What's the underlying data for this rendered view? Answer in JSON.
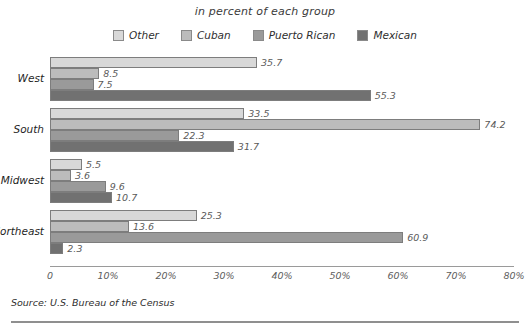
{
  "title": "in percent of each group",
  "source": "Source: U.S. Bureau of the Census",
  "axis": {
    "ticks": [
      "0",
      "10%",
      "20%",
      "30%",
      "40%",
      "50%",
      "60%",
      "70%",
      "80%"
    ]
  },
  "legend": {
    "items": [
      {
        "label": "Other",
        "color": "#d8d8d8"
      },
      {
        "label": "Cuban",
        "color": "#bcbcbc"
      },
      {
        "label": "Puerto Rican",
        "color": "#9a9a9a"
      },
      {
        "label": "Mexican",
        "color": "#717171"
      }
    ]
  },
  "chart_data": {
    "type": "bar",
    "orientation": "horizontal",
    "title": "in percent of each group",
    "xlabel": "",
    "ylabel": "",
    "xlim": [
      0,
      80
    ],
    "grid": false,
    "legend_position": "top-center",
    "categories": [
      "West",
      "South",
      "Midwest",
      "Northeast"
    ],
    "series": [
      {
        "name": "Other",
        "color": "#d8d8d8",
        "values": [
          35.7,
          33.5,
          5.5,
          25.3
        ]
      },
      {
        "name": "Cuban",
        "color": "#bcbcbc",
        "values": [
          8.5,
          74.2,
          3.6,
          13.6
        ]
      },
      {
        "name": "Puerto Rican",
        "color": "#9a9a9a",
        "values": [
          7.5,
          22.3,
          9.6,
          60.9
        ]
      },
      {
        "name": "Mexican",
        "color": "#717171",
        "values": [
          55.3,
          31.7,
          10.7,
          2.3
        ]
      }
    ],
    "value_labels": {
      "West": [
        "35.7",
        "8.5",
        "7.5",
        "55.3"
      ],
      "South": [
        "33.5",
        "74.2",
        "22.3",
        "31.7"
      ],
      "Midwest": [
        "5.5",
        "3.6",
        "9.6",
        "10.7"
      ],
      "Northeast": [
        "25.3",
        "13.6",
        "60.9",
        "2.3"
      ]
    }
  }
}
